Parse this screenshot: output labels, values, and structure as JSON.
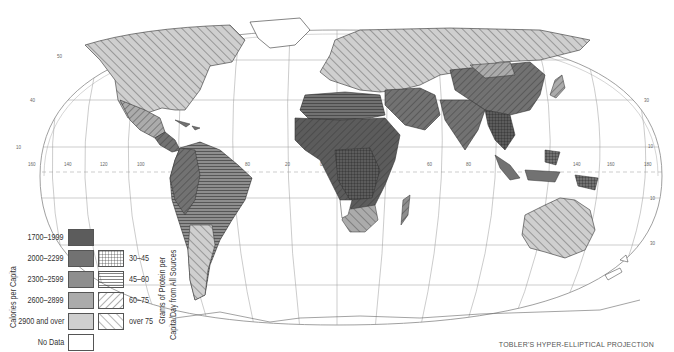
{
  "map": {
    "projection_label": "TOBLER'S HYPER-ELLIPTICAL PROJECTION",
    "longitude_ticks": [
      "160",
      "140",
      "120",
      "100",
      "80",
      "20",
      "0",
      "60",
      "80",
      "140",
      "160",
      "180"
    ],
    "latitude_ticks": [
      "50",
      "30",
      "10",
      "10",
      "30",
      "50"
    ]
  },
  "legend": {
    "calories": {
      "title": "Calories per Capita",
      "items": [
        {
          "label": "1700–1999",
          "color": "#5c5c5c"
        },
        {
          "label": "2000–2299",
          "color": "#727272"
        },
        {
          "label": "2300–2599",
          "color": "#8e8e8e"
        },
        {
          "label": "2600–2899",
          "color": "#ababab"
        },
        {
          "label": "2900 and over",
          "color": "#cfcfcf"
        },
        {
          "label": "No Data",
          "color": "#ffffff"
        }
      ]
    },
    "protein": {
      "title_line1": "Grams of Protein per",
      "title_line2": "Capita/Day from All Sources",
      "items": [
        {
          "label": "30–45",
          "pattern": "grid"
        },
        {
          "label": "45–60",
          "pattern": "horizontal"
        },
        {
          "label": "60–75",
          "pattern": "diagonal-forward"
        },
        {
          "label": "over 75",
          "pattern": "diagonal-back"
        }
      ]
    }
  }
}
